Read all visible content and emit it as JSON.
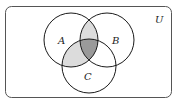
{
  "diagram": {
    "type": "venn",
    "universe_label": "U",
    "sets": [
      {
        "id": "A",
        "label": "A",
        "cx": 71,
        "cy": 40,
        "r": 27
      },
      {
        "id": "B",
        "label": "B",
        "cx": 107,
        "cy": 40,
        "r": 27
      },
      {
        "id": "C",
        "label": "C",
        "cx": 89,
        "cy": 66,
        "r": 27
      }
    ],
    "shaded_regions": [
      {
        "region": "A∩B∩C'",
        "color": "#dcdcdc"
      },
      {
        "region": "A∩C∩B'",
        "color": "#dcdcdc"
      },
      {
        "region": "A∩B∩C",
        "color": "#9a9a9a"
      }
    ],
    "colors": {
      "light_shade": "#dcdcdc",
      "dark_shade": "#9a9a9a",
      "outline": "#1a1a1a",
      "frame": "#555555"
    }
  }
}
